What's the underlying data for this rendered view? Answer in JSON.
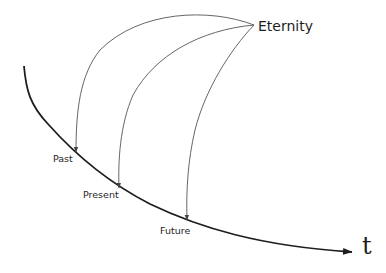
{
  "diagram": {
    "nodes": {
      "eternity": "Eternity",
      "past": "Past",
      "present": "Present",
      "future": "Future",
      "time_axis": "t"
    },
    "edges": [
      {
        "from": "Eternity",
        "to": "Past"
      },
      {
        "from": "Eternity",
        "to": "Present"
      },
      {
        "from": "Eternity",
        "to": "Future"
      }
    ],
    "colors": {
      "timeline": "#1e1e1e",
      "arcs": "#555555",
      "text": "#1e1e1e"
    }
  }
}
